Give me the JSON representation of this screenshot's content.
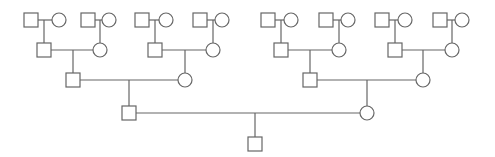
{
  "diagram": {
    "type": "pedigree-chart",
    "colors": {
      "line": "#666666",
      "fill": "#ffffff",
      "background": "#ffffff"
    },
    "symbol_size": 14,
    "legend": {
      "square": "male",
      "circle": "female"
    },
    "individuals": [
      {
        "id": "g1m1",
        "sex": "male",
        "cx": 31,
        "cy": 20
      },
      {
        "id": "g1f1",
        "sex": "female",
        "cx": 59,
        "cy": 20
      },
      {
        "id": "g1m2",
        "sex": "male",
        "cx": 88,
        "cy": 20
      },
      {
        "id": "g1f2",
        "sex": "female",
        "cx": 109,
        "cy": 20
      },
      {
        "id": "g1m3",
        "sex": "male",
        "cx": 142,
        "cy": 20
      },
      {
        "id": "g1f3",
        "sex": "female",
        "cx": 166,
        "cy": 20
      },
      {
        "id": "g1m4",
        "sex": "male",
        "cx": 200,
        "cy": 20
      },
      {
        "id": "g1f4",
        "sex": "female",
        "cx": 222,
        "cy": 20
      },
      {
        "id": "g1m5",
        "sex": "male",
        "cx": 268,
        "cy": 20
      },
      {
        "id": "g1f5",
        "sex": "female",
        "cx": 291,
        "cy": 20
      },
      {
        "id": "g1m6",
        "sex": "male",
        "cx": 326,
        "cy": 20
      },
      {
        "id": "g1f6",
        "sex": "female",
        "cx": 348,
        "cy": 20
      },
      {
        "id": "g1m7",
        "sex": "male",
        "cx": 382,
        "cy": 20
      },
      {
        "id": "g1f7",
        "sex": "female",
        "cx": 405,
        "cy": 20
      },
      {
        "id": "g1m8",
        "sex": "male",
        "cx": 440,
        "cy": 20
      },
      {
        "id": "g1f8",
        "sex": "female",
        "cx": 462,
        "cy": 20
      },
      {
        "id": "g2m1",
        "sex": "male",
        "cx": 44,
        "cy": 50
      },
      {
        "id": "g2f1",
        "sex": "female",
        "cx": 100,
        "cy": 50
      },
      {
        "id": "g2m2",
        "sex": "male",
        "cx": 155,
        "cy": 50
      },
      {
        "id": "g2f2",
        "sex": "female",
        "cx": 213,
        "cy": 50
      },
      {
        "id": "g2m3",
        "sex": "male",
        "cx": 281,
        "cy": 50
      },
      {
        "id": "g2f3",
        "sex": "female",
        "cx": 339,
        "cy": 50
      },
      {
        "id": "g2m4",
        "sex": "male",
        "cx": 395,
        "cy": 50
      },
      {
        "id": "g2f4",
        "sex": "female",
        "cx": 452,
        "cy": 50
      },
      {
        "id": "g3m1",
        "sex": "male",
        "cx": 73,
        "cy": 80
      },
      {
        "id": "g3f1",
        "sex": "female",
        "cx": 185,
        "cy": 80
      },
      {
        "id": "g3m2",
        "sex": "male",
        "cx": 310,
        "cy": 80
      },
      {
        "id": "g3f2",
        "sex": "female",
        "cx": 423,
        "cy": 80
      },
      {
        "id": "g4m1",
        "sex": "male",
        "cx": 129,
        "cy": 113
      },
      {
        "id": "g4f1",
        "sex": "female",
        "cx": 367,
        "cy": 113
      },
      {
        "id": "g5m1",
        "sex": "male",
        "cx": 255,
        "cy": 144
      }
    ],
    "couples": [
      {
        "a": "g1m1",
        "b": "g1f1",
        "child": "g2m1"
      },
      {
        "a": "g1m2",
        "b": "g1f2",
        "child": "g2f1"
      },
      {
        "a": "g1m3",
        "b": "g1f3",
        "child": "g2m2"
      },
      {
        "a": "g1m4",
        "b": "g1f4",
        "child": "g2f2"
      },
      {
        "a": "g1m5",
        "b": "g1f5",
        "child": "g2m3"
      },
      {
        "a": "g1m6",
        "b": "g1f6",
        "child": "g2f3"
      },
      {
        "a": "g1m7",
        "b": "g1f7",
        "child": "g2m4"
      },
      {
        "a": "g1m8",
        "b": "g1f8",
        "child": "g2f4"
      },
      {
        "a": "g2m1",
        "b": "g2f1",
        "child": "g3m1"
      },
      {
        "a": "g2m2",
        "b": "g2f2",
        "child": "g3f1"
      },
      {
        "a": "g2m3",
        "b": "g2f3",
        "child": "g3m2"
      },
      {
        "a": "g2m4",
        "b": "g2f4",
        "child": "g3f2"
      },
      {
        "a": "g3m1",
        "b": "g3f1",
        "child": "g4m1"
      },
      {
        "a": "g3m2",
        "b": "g3f2",
        "child": "g4f1"
      },
      {
        "a": "g4m1",
        "b": "g4f1",
        "child": "g5m1"
      }
    ]
  }
}
